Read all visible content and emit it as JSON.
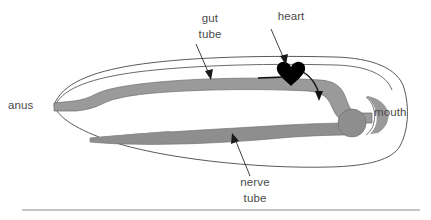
{
  "figure": {
    "title_visible": false,
    "background_color": "#ffffff",
    "rule": {
      "name": "horizontal-rule",
      "color": "#8a8a8a",
      "x1": 22,
      "x2": 420,
      "y": 210
    }
  },
  "labels": {
    "anus": {
      "text": "anus",
      "x": 8,
      "y": 109,
      "anchor": "start"
    },
    "mouth": {
      "text": "mouth",
      "x": 374,
      "y": 116,
      "anchor": "start"
    },
    "gut_tube_line1": {
      "text": "gut",
      "x": 210,
      "y": 22,
      "anchor": "middle"
    },
    "gut_tube_line2": {
      "text": "tube",
      "x": 210,
      "y": 38,
      "anchor": "middle"
    },
    "heart": {
      "text": "heart",
      "x": 291,
      "y": 20,
      "anchor": "middle"
    },
    "nerve_tube_line1": {
      "text": "nerve",
      "x": 255,
      "y": 186,
      "anchor": "middle"
    },
    "nerve_tube_line2": {
      "text": "tube",
      "x": 255,
      "y": 202,
      "anchor": "middle"
    }
  },
  "structures": {
    "body_outline": {
      "name": "body-outline",
      "stroke": "#5a5a5a",
      "fill": "#ffffff",
      "stroke_width": 1
    },
    "gut_tube": {
      "name": "gut-tube",
      "fill": "#9a9a9a",
      "stroke": "#6a6a6a"
    },
    "nerve_tube": {
      "name": "nerve-tube",
      "fill": "#8e8e8e",
      "stroke": "#6a6a6a"
    },
    "brain_bulb": {
      "name": "brain-bulb",
      "fill": "#8e8e8e",
      "cx": 352,
      "cy": 123,
      "r": 14
    },
    "heart_shape": {
      "name": "heart-shape",
      "fill": "#000000",
      "cx": 291,
      "cy": 76
    },
    "mouth_notch": {
      "name": "mouth-notch",
      "fill": "#9a9a9a"
    }
  },
  "annotations": {
    "arrow_color": "#1a1a1a",
    "gut_tube_arrow": {
      "name": "gut-tube-arrow",
      "x1": 196,
      "y1": 44,
      "x2": 211,
      "y2": 79
    },
    "heart_arrow": {
      "name": "heart-arrow",
      "x1": 271,
      "y1": 29,
      "x2": 286,
      "y2": 64
    },
    "nerve_tube_arrow": {
      "name": "nerve-tube-arrow",
      "x1": 250,
      "y1": 176,
      "x2": 233,
      "y2": 134
    },
    "blood_flow_in": {
      "name": "blood-flow-inflow-line",
      "x1": 258,
      "y1": 78,
      "x2": 283,
      "y2": 78
    },
    "blood_flow_out": {
      "name": "blood-flow-outflow-arrow",
      "from": "heart",
      "to": "gut tube"
    }
  }
}
